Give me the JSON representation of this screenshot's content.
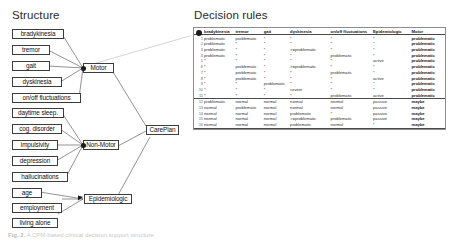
{
  "figure": {
    "structure_title": "Structure",
    "rules_title": "Decision rules",
    "caption_prefix": "Fig. 2.",
    "caption_text": "A CPM-based clinical decision support structure"
  },
  "structure": {
    "motor_inputs": [
      {
        "id": "bradykinesia",
        "label": "bradykinesia"
      },
      {
        "id": "tremor",
        "label": "tremor"
      },
      {
        "id": "gait",
        "label": "gait"
      },
      {
        "id": "dyskinesia",
        "label": "dyskinesia"
      },
      {
        "id": "onoff",
        "label": "on/off fluctuations"
      }
    ],
    "nonmotor_inputs": [
      {
        "id": "daytime-sleep",
        "label": "daytime sleep."
      },
      {
        "id": "cog-disorder",
        "label": "cog. disorder"
      },
      {
        "id": "impulsivity",
        "label": "impulsivity"
      },
      {
        "id": "depression",
        "label": "depression"
      },
      {
        "id": "hallucinations",
        "label": "hallucinations"
      }
    ],
    "epidemiologic_inputs": [
      {
        "id": "age",
        "label": "age"
      },
      {
        "id": "employment",
        "label": "employment"
      },
      {
        "id": "living-alone",
        "label": "living alone"
      }
    ],
    "intermediate_nodes": [
      {
        "id": "motor",
        "label": "Motor"
      },
      {
        "id": "non-motor",
        "label": "Non-Motor"
      },
      {
        "id": "epidemiologic",
        "label": "Epidemiologic"
      }
    ],
    "output_node": {
      "id": "careplan",
      "label": "CarePlan"
    }
  },
  "rules_table": {
    "columns": [
      "",
      "bradykinesia",
      "tremor",
      "gait",
      "dyskinesia",
      "on/off fluctuations",
      "Epidemiologic",
      "Motor"
    ],
    "rows": [
      {
        "n": "1",
        "bradykinesia": "problematic",
        "tremor": "problematic",
        "gait": "*",
        "dyskinesia": "*",
        "onoff": "*",
        "epidemiologic": "*",
        "motor": "problematic"
      },
      {
        "n": "2",
        "bradykinesia": "problematic",
        "tremor": "*",
        "gait": "*",
        "dyskinesia": "*",
        "onoff": "*",
        "epidemiologic": "*",
        "motor": "problematic"
      },
      {
        "n": "3",
        "bradykinesia": "problematic",
        "tremor": "*",
        "gait": "*",
        "dyskinesia": ">=problematic",
        "onoff": "*",
        "epidemiologic": "*",
        "motor": "problematic"
      },
      {
        "n": "4",
        "bradykinesia": "problematic",
        "tremor": "*",
        "gait": "*",
        "dyskinesia": "*",
        "onoff": "problematic",
        "epidemiologic": "*",
        "motor": "problematic"
      },
      {
        "n": "5",
        "bradykinesia": "*",
        "tremor": "*",
        "gait": "*",
        "dyskinesia": "*",
        "onoff": "*",
        "epidemiologic": "active",
        "motor": "problematic"
      },
      {
        "n": "6",
        "bradykinesia": "*",
        "tremor": "problematic",
        "gait": "*",
        "dyskinesia": ">=problematic",
        "onoff": "*",
        "epidemiologic": "*",
        "motor": "problematic"
      },
      {
        "n": "7",
        "bradykinesia": "*",
        "tremor": "problematic",
        "gait": "*",
        "dyskinesia": "*",
        "onoff": "problematic",
        "epidemiologic": "*",
        "motor": "problematic"
      },
      {
        "n": "8",
        "bradykinesia": "*",
        "tremor": "problematic",
        "gait": "*",
        "dyskinesia": "*",
        "onoff": "*",
        "epidemiologic": "active",
        "motor": "problematic"
      },
      {
        "n": "9",
        "bradykinesia": "*",
        "tremor": "*",
        "gait": "problematic",
        "dyskinesia": "*",
        "onoff": "*",
        "epidemiologic": "*",
        "motor": "problematic"
      },
      {
        "n": "10",
        "bradykinesia": "*",
        "tremor": "*",
        "gait": "*",
        "dyskinesia": "severe",
        "onoff": "*",
        "epidemiologic": "*",
        "motor": "problematic"
      },
      {
        "n": "11",
        "bradykinesia": "*",
        "tremor": "*",
        "gait": "*",
        "dyskinesia": "*",
        "onoff": "problematic",
        "epidemiologic": "active",
        "motor": "problematic"
      },
      {
        "n": "12",
        "bradykinesia": "problematic",
        "tremor": "normal",
        "gait": "normal",
        "dyskinesia": "normal",
        "onoff": "normal",
        "epidemiologic": "passive",
        "motor": "maybe"
      },
      {
        "n": "13",
        "bradykinesia": "normal",
        "tremor": "problematic",
        "gait": "normal",
        "dyskinesia": "normal",
        "onoff": "normal",
        "epidemiologic": "passive",
        "motor": "maybe"
      },
      {
        "n": "14",
        "bradykinesia": "normal",
        "tremor": "normal",
        "gait": "normal",
        "dyskinesia": "problematic",
        "onoff": "*",
        "epidemiologic": "passive",
        "motor": "maybe"
      },
      {
        "n": "15",
        "bradykinesia": "normal",
        "tremor": "normal",
        "gait": "normal",
        "dyskinesia": ">=problematic",
        "onoff": "problematic",
        "epidemiologic": "passive",
        "motor": "maybe"
      },
      {
        "n": "16",
        "bradykinesia": "normal",
        "tremor": "normal",
        "gait": "normal",
        "dyskinesia": "problematic",
        "onoff": "normal",
        "epidemiologic": "*",
        "motor": "maybe"
      },
      {
        "n": "17",
        "bradykinesia": "normal",
        "tremor": "normal",
        "gait": "normal",
        "dyskinesia": "normal",
        "onoff": "normal",
        "epidemiologic": "*",
        "motor": "normal"
      }
    ]
  },
  "colors": {
    "node_border": "#3c3c3c",
    "edge": "#4a4a4a",
    "dot": "#1a1a1a",
    "table_border": "#8d8d8d",
    "highlight_edge": "#cfcfcf"
  }
}
